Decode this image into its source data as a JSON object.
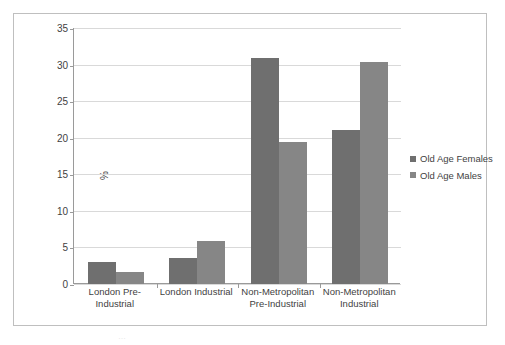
{
  "chart_data": {
    "type": "bar",
    "title": "",
    "xlabel": "",
    "ylabel": "%",
    "ylim": [
      0,
      35
    ],
    "yticks": [
      0,
      5,
      10,
      15,
      20,
      25,
      30,
      35
    ],
    "grid": true,
    "legend_position": "right",
    "categories": [
      "London Pre-Industrial",
      "London Industrial",
      "Non-Metropolitan Pre-Industrial",
      "Non-Metropolitan Industrial"
    ],
    "category_lines": [
      [
        "London Pre-",
        "Industrial"
      ],
      [
        "London Industrial"
      ],
      [
        "Non-Metropolitan",
        "Pre-Industrial"
      ],
      [
        "Non-Metropolitan",
        "Industrial"
      ]
    ],
    "series": [
      {
        "name": "Old Age Females",
        "color": "#6f6f6f",
        "values": [
          3.0,
          3.6,
          30.9,
          21.1
        ]
      },
      {
        "name": "Old Age Males",
        "color": "#868686",
        "values": [
          1.6,
          5.9,
          19.4,
          30.4
        ]
      }
    ]
  },
  "caption": {
    "clipped_text": "…"
  }
}
